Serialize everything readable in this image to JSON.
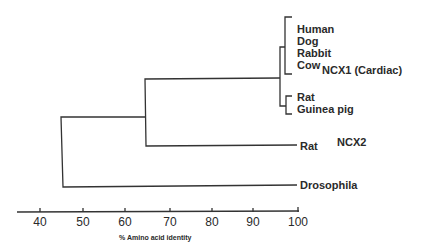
{
  "diagram": {
    "type": "phylogenetic-tree",
    "leaves": [
      {
        "label": "Human"
      },
      {
        "label": "Dog"
      },
      {
        "label": "Rabbit"
      },
      {
        "label": "Cow"
      },
      {
        "label": "Rat"
      },
      {
        "label": "Guinea pig"
      },
      {
        "label": "Rat"
      },
      {
        "label": "Drosophila"
      }
    ],
    "groups": [
      {
        "label": "NCX1 (Cardiac)"
      },
      {
        "label": "NCX2"
      }
    ],
    "axis": {
      "ticks": [
        "40",
        "50",
        "60",
        "70",
        "80",
        "90",
        "100"
      ],
      "label": "% Amino acid identity"
    },
    "nodes": [
      {
        "name": "root",
        "identity": 45
      },
      {
        "name": "NCX1-NCX2",
        "identity": 64
      },
      {
        "name": "NCX1",
        "identity": 96
      }
    ]
  }
}
